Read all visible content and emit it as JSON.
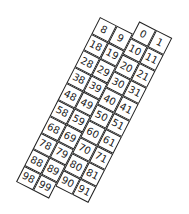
{
  "grid": {
    "columns": [
      "A",
      "B",
      "C",
      "D"
    ],
    "rows": [
      [
        "8",
        "9",
        "0",
        "1"
      ],
      [
        "18",
        "19",
        "10",
        "11"
      ],
      [
        "28",
        "29",
        "20",
        "21"
      ],
      [
        "38",
        "39",
        "30",
        "31"
      ],
      [
        "48",
        "49",
        "40",
        "41"
      ],
      [
        "58",
        "59",
        "50",
        "51"
      ],
      [
        "68",
        "69",
        "60",
        "61"
      ],
      [
        "78",
        "79",
        "70",
        "71"
      ],
      [
        "88",
        "89",
        "80",
        "81"
      ],
      [
        "98",
        "99",
        "90",
        "91"
      ]
    ]
  }
}
